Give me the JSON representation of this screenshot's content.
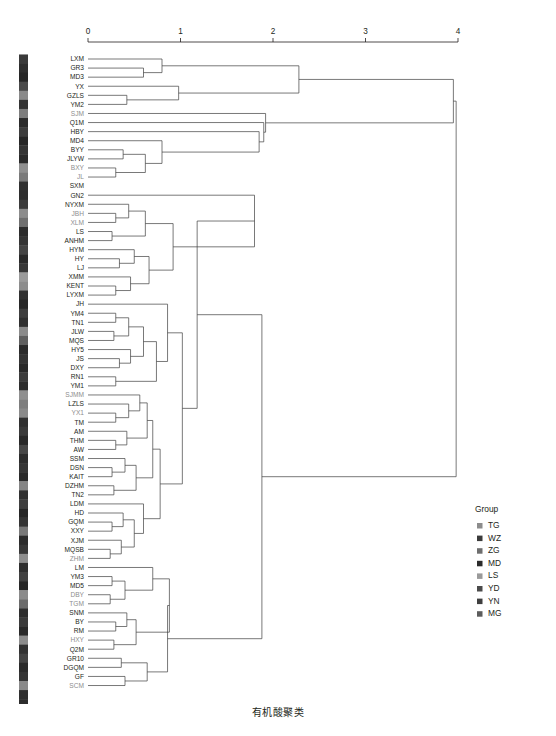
{
  "caption": "有机酸聚类",
  "axis": {
    "ticks": [
      "0",
      "1",
      "2",
      "3",
      "4"
    ],
    "min": 0,
    "max": 4,
    "x_px_min": 88,
    "x_px_max": 458,
    "y_px": 42
  },
  "legend": {
    "title": "Group",
    "items": [
      {
        "label": "TG",
        "color": "#8c8c8c"
      },
      {
        "label": "WZ",
        "color": "#3a3a3a"
      },
      {
        "label": "ZG",
        "color": "#6e6e6e"
      },
      {
        "label": "MD",
        "color": "#2b2b2b"
      },
      {
        "label": "LS",
        "color": "#9a9a9a"
      },
      {
        "label": "YD",
        "color": "#4a4a4a"
      },
      {
        "label": "YN",
        "color": "#3f3f3f"
      },
      {
        "label": "MG",
        "color": "#5c5c5c"
      }
    ]
  },
  "chart_data": {
    "type": "dendrogram",
    "title": "有机酸聚类",
    "xlabel": "",
    "ylabel": "",
    "xlim": [
      0,
      4
    ],
    "grid": false,
    "legend_position": "right",
    "n_leaves": 72,
    "leaves": [
      {
        "label": "LXM",
        "color": "#231f20",
        "strip": "#3a3a3a"
      },
      {
        "label": "GR3",
        "color": "#231f20",
        "strip": "#2e2e2e"
      },
      {
        "label": "MD3",
        "color": "#231f20",
        "strip": "#262626"
      },
      {
        "label": "YX",
        "color": "#231f20",
        "strip": "#4a4a4a"
      },
      {
        "label": "GZLS",
        "color": "#231f20",
        "strip": "#8a8a8a"
      },
      {
        "label": "YM2",
        "color": "#231f20",
        "strip": "#333333"
      },
      {
        "label": "SJM",
        "color": "#8e8e8e",
        "strip": "#7d7d7d"
      },
      {
        "label": "Q1M",
        "color": "#231f20",
        "strip": "#2b2b2b"
      },
      {
        "label": "HBY",
        "color": "#231f20",
        "strip": "#3d3d3d"
      },
      {
        "label": "MD4",
        "color": "#231f20",
        "strip": "#262626"
      },
      {
        "label": "BYY",
        "color": "#231f20",
        "strip": "#343434"
      },
      {
        "label": "JLYW",
        "color": "#231f20",
        "strip": "#2a2a2a"
      },
      {
        "label": "BXY",
        "color": "#8e8e8e",
        "strip": "#8f8f8f"
      },
      {
        "label": "JL",
        "color": "#8e8e8e",
        "strip": "#7a7a7a"
      },
      {
        "label": "SXM",
        "color": "#231f20",
        "strip": "#303030"
      },
      {
        "label": "GN2",
        "color": "#231f20",
        "strip": "#2d2d2d"
      },
      {
        "label": "NYXM",
        "color": "#231f20",
        "strip": "#3b3b3b"
      },
      {
        "label": "JBH",
        "color": "#8e8e8e",
        "strip": "#8c8c8c"
      },
      {
        "label": "XLM",
        "color": "#8e8e8e",
        "strip": "#6f6f6f"
      },
      {
        "label": "LS",
        "color": "#231f20",
        "strip": "#2c2c2c"
      },
      {
        "label": "ANHM",
        "color": "#231f20",
        "strip": "#353535"
      },
      {
        "label": "HYM",
        "color": "#231f20",
        "strip": "#454545"
      },
      {
        "label": "HY",
        "color": "#231f20",
        "strip": "#2a2a2a"
      },
      {
        "label": "LJ",
        "color": "#231f20",
        "strip": "#383838"
      },
      {
        "label": "XMM",
        "color": "#231f20",
        "strip": "#9b9b9b"
      },
      {
        "label": "KENT",
        "color": "#231f20",
        "strip": "#8d8d8d"
      },
      {
        "label": "LYXM",
        "color": "#231f20",
        "strip": "#313131"
      },
      {
        "label": "JH",
        "color": "#231f20",
        "strip": "#272727"
      },
      {
        "label": "YM4",
        "color": "#231f20",
        "strip": "#3e3e3e"
      },
      {
        "label": "TN1",
        "color": "#231f20",
        "strip": "#2f2f2f"
      },
      {
        "label": "JLW",
        "color": "#231f20",
        "strip": "#8b8b8b"
      },
      {
        "label": "MQS",
        "color": "#231f20",
        "strip": "#606060"
      },
      {
        "label": "HY5",
        "color": "#231f20",
        "strip": "#2b2b2b"
      },
      {
        "label": "JS",
        "color": "#231f20",
        "strip": "#343434"
      },
      {
        "label": "DXY",
        "color": "#231f20",
        "strip": "#292929"
      },
      {
        "label": "RN1",
        "color": "#231f20",
        "strip": "#3c3c3c"
      },
      {
        "label": "YM1",
        "color": "#231f20",
        "strip": "#2e2e2e"
      },
      {
        "label": "SJMM",
        "color": "#8e8e8e",
        "strip": "#909090"
      },
      {
        "label": "LZLS",
        "color": "#231f20",
        "strip": "#7e7e7e"
      },
      {
        "label": "YX1",
        "color": "#8e8e8e",
        "strip": "#8a8a8a"
      },
      {
        "label": "TM",
        "color": "#231f20",
        "strip": "#303030"
      },
      {
        "label": "AM",
        "color": "#231f20",
        "strip": "#3a3a3a"
      },
      {
        "label": "THM",
        "color": "#231f20",
        "strip": "#282828"
      },
      {
        "label": "AW",
        "color": "#231f20",
        "strip": "#474747"
      },
      {
        "label": "SSM",
        "color": "#231f20",
        "strip": "#2d2d2d"
      },
      {
        "label": "DSN",
        "color": "#231f20",
        "strip": "#363636"
      },
      {
        "label": "KAIT",
        "color": "#231f20",
        "strip": "#2a2a2a"
      },
      {
        "label": "DZHM",
        "color": "#231f20",
        "strip": "#858585"
      },
      {
        "label": "TN2",
        "color": "#231f20",
        "strip": "#313131"
      },
      {
        "label": "LDM",
        "color": "#231f20",
        "strip": "#3f3f3f"
      },
      {
        "label": "HD",
        "color": "#231f20",
        "strip": "#262626"
      },
      {
        "label": "GQM",
        "color": "#231f20",
        "strip": "#343434"
      },
      {
        "label": "XXY",
        "color": "#231f20",
        "strip": "#797979"
      },
      {
        "label": "XJM",
        "color": "#231f20",
        "strip": "#2c2c2c"
      },
      {
        "label": "MQSB",
        "color": "#231f20",
        "strip": "#383838"
      },
      {
        "label": "ZHM",
        "color": "#8e8e8e",
        "strip": "#8e8e8e"
      },
      {
        "label": "LM",
        "color": "#231f20",
        "strip": "#2f2f2f"
      },
      {
        "label": "YM3",
        "color": "#231f20",
        "strip": "#414141"
      },
      {
        "label": "MD5",
        "color": "#231f20",
        "strip": "#272727"
      },
      {
        "label": "DBY",
        "color": "#8e8e8e",
        "strip": "#8b8b8b"
      },
      {
        "label": "TGM",
        "color": "#8e8e8e",
        "strip": "#6b6b6b"
      },
      {
        "label": "SNM",
        "color": "#231f20",
        "strip": "#2e2e2e"
      },
      {
        "label": "BY",
        "color": "#231f20",
        "strip": "#3b3b3b"
      },
      {
        "label": "RM",
        "color": "#231f20",
        "strip": "#292929"
      },
      {
        "label": "HXY",
        "color": "#8e8e8e",
        "strip": "#8d8d8d"
      },
      {
        "label": "Q2M",
        "color": "#231f20",
        "strip": "#333333"
      },
      {
        "label": "GR10",
        "color": "#231f20",
        "strip": "#444444"
      },
      {
        "label": "DGQM",
        "color": "#231f20",
        "strip": "#2b2b2b"
      },
      {
        "label": "GF",
        "color": "#231f20",
        "strip": "#353535"
      },
      {
        "label": "SCM",
        "color": "#8e8e8e",
        "strip": "#8a8a8a"
      },
      {
        "label": "",
        "color": "#231f20",
        "strip": "#303030"
      },
      {
        "label": "",
        "color": "#231f20",
        "strip": "#2d2d2d"
      }
    ],
    "merges": [
      {
        "a": {
          "leaf": 1
        },
        "b": {
          "leaf": 2
        },
        "h": 0.6
      },
      {
        "a": {
          "leaf": 0
        },
        "b": {
          "node": 0
        },
        "h": 0.8
      },
      {
        "a": {
          "leaf": 4
        },
        "b": {
          "leaf": 5
        },
        "h": 0.42
      },
      {
        "a": {
          "leaf": 3
        },
        "b": {
          "node": 2
        },
        "h": 0.98
      },
      {
        "a": {
          "node": 1
        },
        "b": {
          "node": 3
        },
        "h": 2.28
      },
      {
        "a": {
          "leaf": 10
        },
        "b": {
          "leaf": 11
        },
        "h": 0.38
      },
      {
        "a": {
          "leaf": 12
        },
        "b": {
          "leaf": 13
        },
        "h": 0.3
      },
      {
        "a": {
          "node": 5
        },
        "b": {
          "node": 6
        },
        "h": 0.62
      },
      {
        "a": {
          "leaf": 9
        },
        "b": {
          "node": 7
        },
        "h": 0.8
      },
      {
        "a": {
          "leaf": 8
        },
        "b": {
          "node": 8
        },
        "h": 1.85
      },
      {
        "a": {
          "leaf": 7
        },
        "b": {
          "node": 9
        },
        "h": 1.9
      },
      {
        "a": {
          "leaf": 6
        },
        "b": {
          "node": 10
        },
        "h": 1.92
      },
      {
        "a": {
          "node": 4
        },
        "b": {
          "node": 11
        },
        "h": 3.95
      },
      {
        "a": {
          "leaf": 17
        },
        "b": {
          "leaf": 18
        },
        "h": 0.3
      },
      {
        "a": {
          "leaf": 16
        },
        "b": {
          "node": 13
        },
        "h": 0.44
      },
      {
        "a": {
          "leaf": 19
        },
        "b": {
          "leaf": 20
        },
        "h": 0.26
      },
      {
        "a": {
          "node": 14
        },
        "b": {
          "node": 15
        },
        "h": 0.62
      },
      {
        "a": {
          "leaf": 22
        },
        "b": {
          "leaf": 23
        },
        "h": 0.34
      },
      {
        "a": {
          "leaf": 21
        },
        "b": {
          "node": 17
        },
        "h": 0.5
      },
      {
        "a": {
          "leaf": 25
        },
        "b": {
          "leaf": 26
        },
        "h": 0.3
      },
      {
        "a": {
          "leaf": 24
        },
        "b": {
          "node": 19
        },
        "h": 0.46
      },
      {
        "a": {
          "node": 18
        },
        "b": {
          "node": 20
        },
        "h": 0.66
      },
      {
        "a": {
          "node": 16
        },
        "b": {
          "node": 21
        },
        "h": 0.92
      },
      {
        "a": {
          "leaf": 15
        },
        "b": {
          "node": 22
        },
        "h": 1.8
      },
      {
        "a": {
          "leaf": 28
        },
        "b": {
          "leaf": 29
        },
        "h": 0.3
      },
      {
        "a": {
          "leaf": 30
        },
        "b": {
          "leaf": 31
        },
        "h": 0.28
      },
      {
        "a": {
          "node": 24
        },
        "b": {
          "node": 25
        },
        "h": 0.44
      },
      {
        "a": {
          "leaf": 33
        },
        "b": {
          "leaf": 34
        },
        "h": 0.34
      },
      {
        "a": {
          "leaf": 32
        },
        "b": {
          "node": 27
        },
        "h": 0.46
      },
      {
        "a": {
          "node": 26
        },
        "b": {
          "node": 28
        },
        "h": 0.6
      },
      {
        "a": {
          "leaf": 35
        },
        "b": {
          "leaf": 36
        },
        "h": 0.3
      },
      {
        "a": {
          "node": 29
        },
        "b": {
          "node": 30
        },
        "h": 0.74
      },
      {
        "a": {
          "leaf": 27
        },
        "b": {
          "node": 31
        },
        "h": 0.86
      },
      {
        "a": {
          "leaf": 39
        },
        "b": {
          "leaf": 40
        },
        "h": 0.3
      },
      {
        "a": {
          "leaf": 38
        },
        "b": {
          "node": 33
        },
        "h": 0.44
      },
      {
        "a": {
          "leaf": 37
        },
        "b": {
          "node": 34
        },
        "h": 0.56
      },
      {
        "a": {
          "leaf": 42
        },
        "b": {
          "leaf": 43
        },
        "h": 0.3
      },
      {
        "a": {
          "leaf": 41
        },
        "b": {
          "node": 36
        },
        "h": 0.42
      },
      {
        "a": {
          "node": 35
        },
        "b": {
          "node": 37
        },
        "h": 0.64
      },
      {
        "a": {
          "leaf": 45
        },
        "b": {
          "leaf": 46
        },
        "h": 0.26
      },
      {
        "a": {
          "leaf": 44
        },
        "b": {
          "node": 39
        },
        "h": 0.4
      },
      {
        "a": {
          "leaf": 47
        },
        "b": {
          "leaf": 48
        },
        "h": 0.28
      },
      {
        "a": {
          "node": 40
        },
        "b": {
          "node": 41
        },
        "h": 0.52
      },
      {
        "a": {
          "node": 38
        },
        "b": {
          "node": 42
        },
        "h": 0.7
      },
      {
        "a": {
          "leaf": 51
        },
        "b": {
          "leaf": 52
        },
        "h": 0.26
      },
      {
        "a": {
          "leaf": 50
        },
        "b": {
          "node": 44
        },
        "h": 0.38
      },
      {
        "a": {
          "leaf": 54
        },
        "b": {
          "leaf": 55
        },
        "h": 0.24
      },
      {
        "a": {
          "leaf": 53
        },
        "b": {
          "node": 46
        },
        "h": 0.36
      },
      {
        "a": {
          "node": 45
        },
        "b": {
          "node": 47
        },
        "h": 0.5
      },
      {
        "a": {
          "leaf": 49
        },
        "b": {
          "node": 48
        },
        "h": 0.6
      },
      {
        "a": {
          "node": 43
        },
        "b": {
          "node": 49
        },
        "h": 0.78
      },
      {
        "a": {
          "node": 32
        },
        "b": {
          "node": 50
        },
        "h": 1.02
      },
      {
        "a": {
          "node": 23
        },
        "b": {
          "node": 51
        },
        "h": 1.18
      },
      {
        "a": {
          "leaf": 57
        },
        "b": {
          "leaf": 58
        },
        "h": 0.26
      },
      {
        "a": {
          "leaf": 59
        },
        "b": {
          "leaf": 60
        },
        "h": 0.24
      },
      {
        "a": {
          "node": 53
        },
        "b": {
          "node": 54
        },
        "h": 0.4
      },
      {
        "a": {
          "leaf": 56
        },
        "b": {
          "node": 55
        },
        "h": 0.7
      },
      {
        "a": {
          "leaf": 62
        },
        "b": {
          "leaf": 63
        },
        "h": 0.3
      },
      {
        "a": {
          "leaf": 61
        },
        "b": {
          "node": 57
        },
        "h": 0.42
      },
      {
        "a": {
          "leaf": 64
        },
        "b": {
          "leaf": 65
        },
        "h": 0.28
      },
      {
        "a": {
          "node": 58
        },
        "b": {
          "node": 59
        },
        "h": 0.52
      },
      {
        "a": {
          "node": 56
        },
        "b": {
          "node": 60
        },
        "h": 0.88
      },
      {
        "a": {
          "leaf": 66
        },
        "b": {
          "leaf": 67
        },
        "h": 0.36
      },
      {
        "a": {
          "leaf": 68
        },
        "b": {
          "leaf": 69
        },
        "h": 0.4
      },
      {
        "a": {
          "node": 62
        },
        "b": {
          "node": 63
        },
        "h": 0.64
      },
      {
        "a": {
          "node": 61
        },
        "b": {
          "node": 64
        },
        "h": 0.86
      },
      {
        "a": {
          "node": 52
        },
        "b": {
          "node": 65
        },
        "h": 1.88
      },
      {
        "a": {
          "node": 12
        },
        "b": {
          "node": 66
        },
        "h": 3.98
      }
    ]
  }
}
